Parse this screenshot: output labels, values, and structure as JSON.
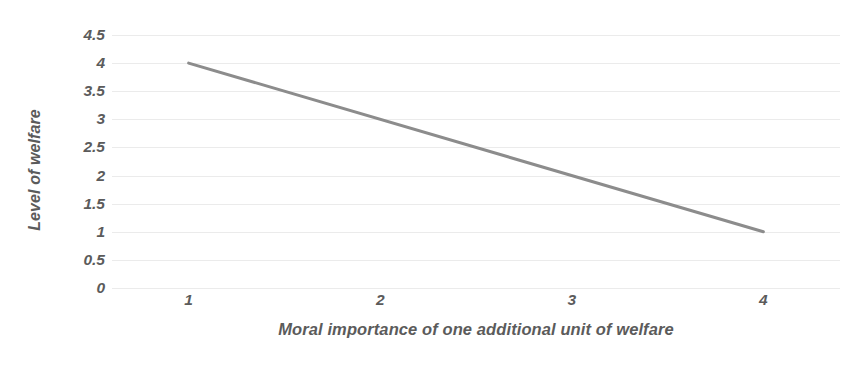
{
  "chart_data": {
    "type": "line",
    "title": "",
    "xlabel": "Moral importance of one additional unit of welfare",
    "ylabel": "Level of welfare",
    "x": [
      1,
      4
    ],
    "values": [
      4,
      1
    ],
    "series": [
      {
        "name": "welfare",
        "points": [
          [
            1,
            4
          ],
          [
            4,
            1
          ]
        ],
        "color": "#8c8c8c"
      }
    ],
    "xlim": [
      0.6,
      4.4
    ],
    "ylim": [
      0,
      4.5
    ],
    "x_ticks": [
      1,
      2,
      3,
      4
    ],
    "x_tick_labels": [
      "1",
      "2",
      "3",
      "4"
    ],
    "y_ticks": [
      0,
      0.5,
      1,
      1.5,
      2,
      2.5,
      3,
      3.5,
      4,
      4.5
    ],
    "y_tick_labels": [
      "0",
      "0.5",
      "1",
      "1.5",
      "2",
      "2.5",
      "3",
      "3.5",
      "4",
      "4.5"
    ],
    "grid": true,
    "grid_axis": "y",
    "legend": false,
    "legend_position": "none",
    "background_color": "#ffffff",
    "grid_color": "#ebebeb",
    "text_color": "#5b5b5b",
    "line_color": "#8c8c8c",
    "line_width": 3
  }
}
